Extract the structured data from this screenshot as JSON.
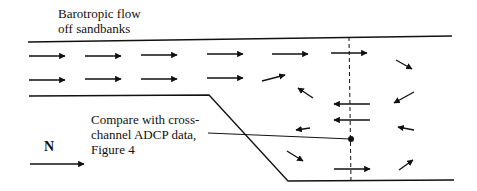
{
  "title_label": {
    "line1": "Barotropic flow",
    "line2": "off sandbanks"
  },
  "annotation": {
    "line1": "Compare with cross-",
    "line2": "channel ADCP data,",
    "line3": "Figure 4"
  },
  "north_indicator": {
    "label": "N",
    "direction": "right"
  },
  "colors": {
    "ink": "#111111",
    "background": "#ffffff"
  },
  "diagram_elements": {
    "top_bank_line": "solid",
    "sandbank_outline": "solid",
    "cross_section_line": "dashed",
    "measurement_point": "dot",
    "flow_arrows": {
      "upstream_rows": 2,
      "description": "Uniform northward flow in two rows, diverging into recirculating eddy downstream of sandbank"
    }
  }
}
